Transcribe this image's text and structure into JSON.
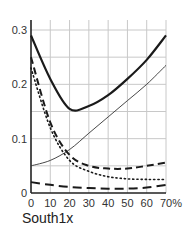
{
  "chart_data": {
    "type": "line",
    "title": "",
    "xlabel": "South1x",
    "ylabel": "",
    "x": [
      0,
      10,
      20,
      30,
      40,
      50,
      60,
      70
    ],
    "xtick_labels": [
      "0",
      "10",
      "20",
      "30",
      "40",
      "50",
      "60",
      "70%"
    ],
    "ytick_values": [
      0,
      0.1,
      0.2,
      0.3
    ],
    "ytick_labels": [
      "0",
      "0.1",
      "0.2",
      "0.3"
    ],
    "xlim": [
      0,
      70
    ],
    "ylim": [
      0,
      0.3
    ],
    "grid": true,
    "grid_y_step": 0.05,
    "grid_x_step": 10,
    "legend": "none",
    "series": [
      {
        "name": "thick-solid",
        "style": "solid",
        "width": 2.2,
        "color": "#1a1a1a",
        "values": [
          0.29,
          0.21,
          0.155,
          0.16,
          0.18,
          0.21,
          0.245,
          0.29
        ]
      },
      {
        "name": "thin-solid",
        "style": "solid",
        "width": 0.9,
        "color": "#333333",
        "values": [
          0.05,
          0.06,
          0.08,
          0.11,
          0.14,
          0.17,
          0.2,
          0.235
        ]
      },
      {
        "name": "medium-dashed",
        "style": "dashed",
        "width": 2,
        "color": "#1a1a1a",
        "values": [
          0.25,
          0.13,
          0.07,
          0.05,
          0.045,
          0.045,
          0.05,
          0.056
        ]
      },
      {
        "name": "dotted",
        "style": "dotted",
        "width": 1.6,
        "color": "#1a1a1a",
        "values": [
          0.23,
          0.12,
          0.06,
          0.04,
          0.03,
          0.026,
          0.025,
          0.025
        ]
      },
      {
        "name": "long-dashed",
        "style": "longdash",
        "width": 2,
        "color": "#1a1a1a",
        "values": [
          0.02,
          0.015,
          0.011,
          0.009,
          0.008,
          0.008,
          0.01,
          0.015
        ]
      }
    ]
  },
  "colors": {
    "grid": "#c8c8c8",
    "axis": "#222222",
    "background": "#ffffff"
  }
}
